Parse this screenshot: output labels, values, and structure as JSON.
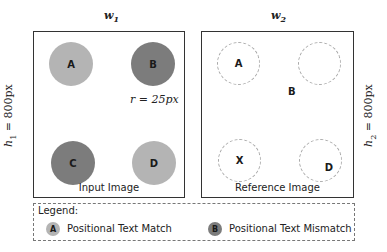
{
  "panels": {
    "input": {
      "width_label": "w",
      "width_sub": "1",
      "height_label": "h",
      "height_sub": "1",
      "height_value": " = 800px",
      "caption": "Input Image",
      "radius_label": "r = 25px",
      "circles": [
        {
          "label": "A",
          "status": "match"
        },
        {
          "label": "B",
          "status": "mismatch"
        },
        {
          "label": "C",
          "status": "mismatch"
        },
        {
          "label": "D",
          "status": "match"
        }
      ]
    },
    "reference": {
      "width_label": "w",
      "width_sub": "2",
      "height_label": "h",
      "height_sub": "2",
      "height_value": " = 800px",
      "caption": "Reference Image",
      "circle_labels": [
        "A",
        "",
        "X",
        "D"
      ],
      "floating_label": "B"
    }
  },
  "legend": {
    "title": "Legend:",
    "items": [
      {
        "glyph": "A",
        "label": "Positional Text Match",
        "color": "#b4b4b4"
      },
      {
        "glyph": "B",
        "label": "Positional Text Mismatch",
        "color": "#7c7c7c"
      }
    ]
  },
  "colors": {
    "match": "#b4b4b4",
    "mismatch": "#7c7c7c",
    "dashed_outline": "#a8a8a8"
  }
}
